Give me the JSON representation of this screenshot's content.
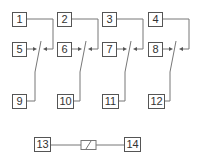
{
  "diagram": {
    "type": "relay-wiring",
    "line_color": "#777777",
    "columns": [
      {
        "top": "1",
        "middle": "5",
        "bottom": "9"
      },
      {
        "top": "2",
        "middle": "6",
        "bottom": "10"
      },
      {
        "top": "3",
        "middle": "7",
        "bottom": "11"
      },
      {
        "top": "4",
        "middle": "8",
        "bottom": "12"
      }
    ],
    "coil": {
      "left": "13",
      "right": "14"
    }
  }
}
